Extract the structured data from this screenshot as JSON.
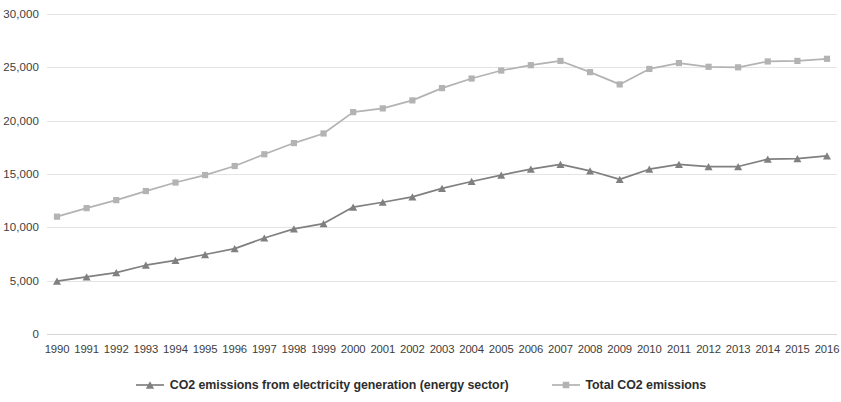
{
  "chart_data": {
    "type": "line",
    "title": "",
    "xlabel": "",
    "ylabel": "",
    "grid": true,
    "legend_position": "bottom",
    "ylim": [
      0,
      30000
    ],
    "ytick_interval": 5000,
    "ytick_labels": [
      "30,000",
      "25,000",
      "20,000",
      "15,000",
      "10,000",
      "5,000",
      "0"
    ],
    "ytick_values": [
      30000,
      25000,
      20000,
      15000,
      10000,
      5000,
      0
    ],
    "categories": [
      "1990",
      "1991",
      "1992",
      "1993",
      "1994",
      "1995",
      "1996",
      "1997",
      "1998",
      "1999",
      "2000",
      "2001",
      "2002",
      "2003",
      "2004",
      "2005",
      "2006",
      "2007",
      "2008",
      "2009",
      "2010",
      "2011",
      "2012",
      "2013",
      "2014",
      "2015",
      "2016"
    ],
    "series": [
      {
        "name": "CO2 emissions from electricity generation (energy sector)",
        "color": "#808080",
        "marker": "triangle",
        "values": [
          4950,
          5350,
          5750,
          6450,
          6900,
          7450,
          8000,
          9000,
          9850,
          10350,
          11900,
          12350,
          12850,
          13650,
          14300,
          14900,
          15450,
          15900,
          15300,
          14500,
          15450,
          15900,
          15700,
          15700,
          16400,
          16450,
          16700
        ]
      },
      {
        "name": "Total CO2 emissions",
        "color": "#b3b3b3",
        "marker": "square",
        "values": [
          11000,
          11800,
          12550,
          13400,
          14200,
          14900,
          15750,
          16850,
          17900,
          18800,
          20800,
          21150,
          21900,
          23050,
          23950,
          24700,
          25200,
          25600,
          24550,
          23400,
          24850,
          25400,
          25050,
          25000,
          25550,
          25600,
          25800
        ]
      }
    ]
  },
  "legend": {
    "items": [
      {
        "label": "CO2 emissions from electricity generation (energy sector)",
        "color": "#808080",
        "marker": "triangle"
      },
      {
        "label": "Total CO2 emissions",
        "color": "#b3b3b3",
        "marker": "square"
      }
    ]
  }
}
